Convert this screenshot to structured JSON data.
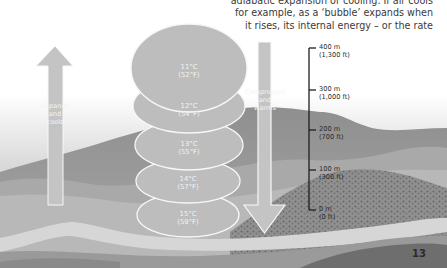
{
  "caption": {
    "lines": [
      "adiabatic expansion or cooling. If air cools",
      "for example, as a ‘bubble’ expands when",
      "it rises, its internal energy – or the rate"
    ]
  },
  "diagram": {
    "up_arrow": {
      "label_lines": [
        "Expands",
        "and",
        "cools"
      ],
      "icon": "arrow-up-icon"
    },
    "down_arrow": {
      "label_lines": [
        "Compresses",
        "and",
        "warms"
      ],
      "icon": "arrow-down-icon"
    },
    "air_parcels": [
      {
        "celsius": "11°C",
        "fahrenheit": "(52°F)"
      },
      {
        "celsius": "12°C",
        "fahrenheit": "(54°F)"
      },
      {
        "celsius": "13°C",
        "fahrenheit": "(55°F)"
      },
      {
        "celsius": "14°C",
        "fahrenheit": "(57°F)"
      },
      {
        "celsius": "15°C",
        "fahrenheit": "(59°F)"
      }
    ],
    "altitude_scale": [
      {
        "meters": "400 m",
        "feet": "(1,300 ft)"
      },
      {
        "meters": "300 m",
        "feet": "(1,000 ft)"
      },
      {
        "meters": "200 m",
        "feet": "(700 ft)"
      },
      {
        "meters": "100 m",
        "feet": "(300 ft)"
      },
      {
        "meters": "0 m",
        "feet": "(0 ft)"
      }
    ]
  },
  "page_number": "13",
  "colors": {
    "parcel_fill": "#bdbdbd",
    "arrow_fill": "#c4c4c4",
    "outline": "#f7f7f7",
    "hill_dark": "#8a8a8a",
    "hill_mid": "#a3a3a3",
    "ground_light": "#cfcfcf",
    "scale_line": "#1e1e1e"
  }
}
